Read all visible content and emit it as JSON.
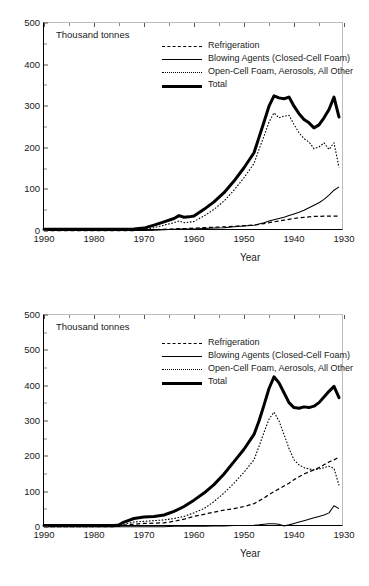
{
  "figure": {
    "panels": [
      "top",
      "bottom"
    ]
  },
  "chart_data": [
    {
      "panel": "top",
      "type": "line",
      "title": "",
      "unit_label": "Thousand tonnes",
      "xlabel": "Year",
      "ylabel": "",
      "x_tick_labels": [
        "1990",
        "1980",
        "1970",
        "1960",
        "1950",
        "1940",
        "1930"
      ],
      "x_ticks": [
        1990,
        1980,
        1970,
        1960,
        1950,
        1940,
        1930
      ],
      "x_minor_step": 5,
      "xlim": [
        1990,
        1930
      ],
      "x_reversed": true,
      "y_tick_labels": [
        "500",
        "400",
        "300",
        "200",
        "100",
        "0"
      ],
      "y_ticks": [
        500,
        400,
        300,
        200,
        100,
        0
      ],
      "y_minor_step": 50,
      "ylim": [
        0,
        500
      ],
      "grid": false,
      "legend_position": "inside-top-center",
      "x": [
        1990,
        1985,
        1980,
        1975,
        1972,
        1970,
        1968,
        1966,
        1964,
        1963,
        1962,
        1961,
        1960,
        1958,
        1956,
        1954,
        1952,
        1950,
        1948,
        1947,
        1946,
        1945,
        1944,
        1943,
        1942,
        1941,
        1940,
        1939,
        1938,
        1937,
        1936,
        1935,
        1934,
        1933,
        1932,
        1931
      ],
      "series": [
        {
          "name": "Total",
          "style": "thick-solid",
          "values": [
            4,
            4,
            4,
            4,
            5,
            7,
            14,
            22,
            30,
            37,
            33,
            34,
            36,
            52,
            70,
            92,
            120,
            152,
            188,
            225,
            262,
            300,
            325,
            320,
            318,
            322,
            300,
            282,
            268,
            260,
            248,
            255,
            272,
            292,
            322,
            274
          ]
        },
        {
          "name": "Open-Cell Foam, Aerosols, All Other",
          "style": "dotted",
          "values": [
            2,
            2,
            2,
            2,
            3,
            4,
            8,
            14,
            20,
            24,
            20,
            21,
            23,
            36,
            52,
            72,
            98,
            128,
            162,
            196,
            228,
            262,
            284,
            272,
            276,
            278,
            256,
            236,
            222,
            214,
            198,
            202,
            212,
            196,
            212,
            153
          ]
        },
        {
          "name": "Blowing Agents (Closed-Cell Foam)",
          "style": "thin-solid",
          "values": [
            1,
            1,
            1,
            1,
            1,
            1,
            2,
            3,
            4,
            5,
            5,
            5,
            5,
            6,
            7,
            8,
            10,
            12,
            14,
            17,
            20,
            24,
            27,
            30,
            33,
            37,
            41,
            45,
            50,
            56,
            62,
            68,
            76,
            86,
            98,
            106
          ]
        },
        {
          "name": "Refrigeration",
          "style": "dashed",
          "values": [
            1,
            1,
            1,
            1,
            1,
            2,
            3,
            4,
            5,
            6,
            6,
            6,
            7,
            8,
            9,
            10,
            11,
            13,
            14,
            16,
            18,
            20,
            22,
            24,
            26,
            28,
            30,
            32,
            33,
            34,
            35,
            35,
            36,
            36,
            36,
            36
          ]
        }
      ]
    },
    {
      "panel": "bottom",
      "type": "line",
      "title": "",
      "unit_label": "Thousand tonnes",
      "xlabel": "Year",
      "ylabel": "",
      "x_tick_labels": [
        "1990",
        "1980",
        "1970",
        "1960",
        "1950",
        "1940",
        "1930"
      ],
      "x_ticks": [
        1990,
        1980,
        1970,
        1960,
        1950,
        1940,
        1930
      ],
      "x_minor_step": 5,
      "xlim": [
        1990,
        1930
      ],
      "x_reversed": true,
      "y_tick_labels": [
        "500",
        "500",
        "400",
        "300",
        "200",
        "100",
        "0"
      ],
      "y_ticks": [
        600,
        500,
        400,
        300,
        200,
        100,
        0
      ],
      "y_minor_step": 50,
      "ylim": [
        0,
        600
      ],
      "grid": false,
      "legend_position": "inside-top-center",
      "x": [
        1990,
        1985,
        1980,
        1976,
        1975,
        1974,
        1972,
        1970,
        1968,
        1966,
        1964,
        1962,
        1960,
        1958,
        1956,
        1954,
        1952,
        1950,
        1948,
        1947,
        1946,
        1945,
        1944,
        1943,
        1942,
        1941,
        1940,
        1939,
        1938,
        1937,
        1936,
        1935,
        1934,
        1933,
        1932,
        1931
      ],
      "series": [
        {
          "name": "Total",
          "style": "thick-solid",
          "values": [
            4,
            4,
            4,
            4,
            6,
            14,
            24,
            28,
            30,
            34,
            44,
            58,
            76,
            96,
            120,
            150,
            185,
            220,
            262,
            300,
            345,
            392,
            425,
            408,
            380,
            352,
            338,
            336,
            340,
            338,
            342,
            352,
            368,
            384,
            398,
            366
          ]
        },
        {
          "name": "Open-Cell Foam, Aerosols, All Other",
          "style": "dotted",
          "values": [
            1,
            1,
            1,
            1,
            2,
            8,
            14,
            16,
            18,
            20,
            24,
            30,
            40,
            52,
            72,
            96,
            124,
            155,
            190,
            228,
            268,
            305,
            325,
            300,
            262,
            222,
            190,
            176,
            168,
            164,
            162,
            164,
            168,
            172,
            166,
            118
          ]
        },
        {
          "name": "Blowing Agents (Closed-Cell Foam)",
          "style": "thin-solid",
          "values": [
            1,
            1,
            1,
            1,
            1,
            1,
            1,
            1,
            1,
            1,
            2,
            2,
            2,
            2,
            3,
            3,
            4,
            4,
            5,
            6,
            8,
            9,
            9,
            8,
            3,
            6,
            10,
            14,
            18,
            22,
            26,
            30,
            34,
            40,
            60,
            52
          ]
        },
        {
          "name": "Refrigeration",
          "style": "dashed",
          "values": [
            1,
            1,
            1,
            1,
            2,
            5,
            8,
            10,
            11,
            12,
            16,
            22,
            30,
            36,
            42,
            48,
            52,
            58,
            66,
            74,
            82,
            92,
            100,
            108,
            116,
            124,
            134,
            142,
            150,
            156,
            162,
            168,
            176,
            184,
            190,
            198
          ]
        }
      ]
    }
  ],
  "legend": {
    "items": [
      {
        "label": "Refrigeration",
        "style": "dashed"
      },
      {
        "label": "Blowing Agents (Closed-Cell Foam)",
        "style": "thin-solid"
      },
      {
        "label": "Open-Cell Foam, Aerosols, All Other",
        "style": "dotted"
      },
      {
        "label": "Total",
        "style": "thick-solid"
      }
    ]
  }
}
